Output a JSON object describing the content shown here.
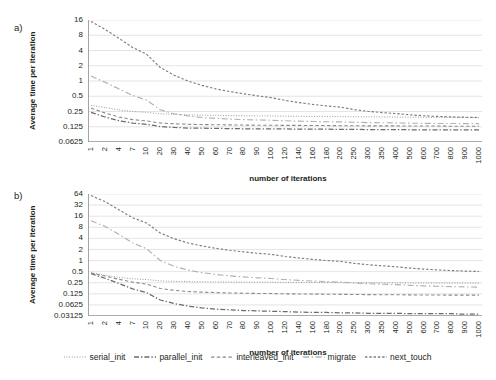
{
  "figure": {
    "panels": [
      {
        "id": "a",
        "label": "a)",
        "ylabel": "Average time per iteration",
        "xlabel": "number of iterations",
        "yticks": [
          "16",
          "8",
          "4",
          "2",
          "1",
          "0.5",
          "0.25",
          "0.125",
          "0.0625"
        ]
      },
      {
        "id": "b",
        "label": "b)",
        "ylabel": "Average time per iteration",
        "xlabel": "number of iterations",
        "yticks": [
          "64",
          "32",
          "16",
          "8",
          "4",
          "2",
          "1",
          "0.5",
          "0.25",
          "0.125",
          "0.0625",
          "0.03125"
        ]
      }
    ],
    "xticks": [
      "1",
      "2",
      "4",
      "7",
      "10",
      "20",
      "30",
      "40",
      "50",
      "60",
      "70",
      "80",
      "90",
      "100",
      "120",
      "140",
      "160",
      "180",
      "200",
      "250",
      "300",
      "350",
      "400",
      "500",
      "600",
      "700",
      "800",
      "900",
      "1000"
    ],
    "legend": [
      {
        "name": "serial_init",
        "style": "dotted",
        "color": "#8c8c8c"
      },
      {
        "name": "parallel_init",
        "style": "dashdot",
        "color": "#6e6e6e"
      },
      {
        "name": "interleaved_init",
        "style": "dashed",
        "color": "#8c8c8c"
      },
      {
        "name": "migrate",
        "style": "dashdot-long",
        "color": "#a8a8a8"
      },
      {
        "name": "next_touch",
        "style": "dash-short",
        "color": "#8c8c8c"
      }
    ]
  },
  "chart_data": [
    {
      "type": "line",
      "panel": "a",
      "title": "",
      "xlabel": "number of iterations",
      "ylabel": "Average time per iteration",
      "yscale": "log2",
      "ylim": [
        0.0625,
        16
      ],
      "yticks": [
        0.0625,
        0.125,
        0.25,
        0.5,
        1,
        2,
        4,
        8,
        16
      ],
      "grid": true,
      "legend_position": "bottom",
      "x": [
        1,
        2,
        4,
        7,
        10,
        20,
        30,
        40,
        50,
        60,
        70,
        80,
        90,
        100,
        120,
        140,
        160,
        180,
        200,
        250,
        300,
        350,
        400,
        500,
        600,
        700,
        800,
        900,
        1000
      ],
      "series": [
        {
          "name": "serial_init",
          "values": [
            0.33,
            0.3,
            0.27,
            0.25,
            0.24,
            0.225,
            0.22,
            0.215,
            0.212,
            0.21,
            0.208,
            0.206,
            0.205,
            0.204,
            0.202,
            0.201,
            0.2,
            0.199,
            0.198,
            0.197,
            0.196,
            0.195,
            0.194,
            0.193,
            0.192,
            0.191,
            0.19,
            0.19,
            0.189
          ]
        },
        {
          "name": "parallel_init",
          "values": [
            0.24,
            0.195,
            0.165,
            0.148,
            0.14,
            0.126,
            0.121,
            0.118,
            0.117,
            0.116,
            0.115,
            0.114,
            0.114,
            0.113,
            0.113,
            0.112,
            0.112,
            0.112,
            0.111,
            0.111,
            0.11,
            0.11,
            0.11,
            0.109,
            0.109,
            0.109,
            0.108,
            0.108,
            0.108
          ]
        },
        {
          "name": "interleaved_init",
          "values": [
            0.29,
            0.235,
            0.195,
            0.173,
            0.163,
            0.148,
            0.143,
            0.14,
            0.138,
            0.137,
            0.136,
            0.135,
            0.134,
            0.134,
            0.133,
            0.133,
            0.132,
            0.132,
            0.131,
            0.131,
            0.13,
            0.13,
            0.13,
            0.129,
            0.129,
            0.129,
            0.128,
            0.128,
            0.128
          ]
        },
        {
          "name": "migrate",
          "values": [
            1.25,
            0.95,
            0.7,
            0.52,
            0.42,
            0.27,
            0.225,
            0.205,
            0.19,
            0.183,
            0.177,
            0.173,
            0.17,
            0.168,
            0.164,
            0.161,
            0.159,
            0.157,
            0.156,
            0.153,
            0.151,
            0.15,
            0.149,
            0.147,
            0.146,
            0.145,
            0.145,
            0.144,
            0.144
          ]
        },
        {
          "name": "next_touch",
          "values": [
            15.0,
            10.5,
            7.0,
            4.6,
            3.4,
            1.85,
            1.3,
            1.0,
            0.82,
            0.7,
            0.62,
            0.56,
            0.51,
            0.47,
            0.415,
            0.375,
            0.345,
            0.322,
            0.305,
            0.272,
            0.252,
            0.238,
            0.228,
            0.215,
            0.206,
            0.2,
            0.196,
            0.193,
            0.19
          ]
        }
      ]
    },
    {
      "type": "line",
      "panel": "b",
      "title": "",
      "xlabel": "number of iterations",
      "ylabel": "Average time per iteration",
      "yscale": "log2",
      "ylim": [
        0.03125,
        64
      ],
      "yticks": [
        0.03125,
        0.0625,
        0.125,
        0.25,
        0.5,
        1,
        2,
        4,
        8,
        16,
        32,
        64
      ],
      "grid": true,
      "legend_position": "bottom",
      "x": [
        1,
        2,
        4,
        7,
        10,
        20,
        30,
        40,
        50,
        60,
        70,
        80,
        90,
        100,
        120,
        140,
        160,
        180,
        200,
        250,
        300,
        350,
        400,
        500,
        600,
        700,
        800,
        900,
        1000
      ],
      "series": [
        {
          "name": "serial_init",
          "values": [
            0.47,
            0.4,
            0.35,
            0.32,
            0.305,
            0.28,
            0.272,
            0.268,
            0.265,
            0.263,
            0.261,
            0.26,
            0.259,
            0.258,
            0.256,
            0.255,
            0.254,
            0.253,
            0.252,
            0.251,
            0.25,
            0.249,
            0.248,
            0.247,
            0.246,
            0.245,
            0.245,
            0.244,
            0.244
          ]
        },
        {
          "name": "parallel_init",
          "values": [
            0.44,
            0.33,
            0.24,
            0.17,
            0.135,
            0.085,
            0.068,
            0.058,
            0.052,
            0.048,
            0.046,
            0.044,
            0.043,
            0.042,
            0.041,
            0.04,
            0.039,
            0.039,
            0.038,
            0.038,
            0.037,
            0.037,
            0.037,
            0.036,
            0.036,
            0.036,
            0.036,
            0.035,
            0.035
          ]
        },
        {
          "name": "interleaved_init",
          "values": [
            0.46,
            0.38,
            0.31,
            0.26,
            0.23,
            0.175,
            0.155,
            0.145,
            0.139,
            0.135,
            0.132,
            0.13,
            0.128,
            0.127,
            0.125,
            0.124,
            0.123,
            0.122,
            0.121,
            0.12,
            0.119,
            0.118,
            0.118,
            0.117,
            0.116,
            0.116,
            0.115,
            0.115,
            0.115
          ]
        },
        {
          "name": "migrate",
          "values": [
            12.0,
            8.5,
            5.2,
            3.0,
            2.1,
            1.0,
            0.7,
            0.55,
            0.47,
            0.42,
            0.385,
            0.36,
            0.34,
            0.325,
            0.305,
            0.29,
            0.278,
            0.268,
            0.26,
            0.245,
            0.235,
            0.228,
            0.222,
            0.212,
            0.205,
            0.2,
            0.196,
            0.192,
            0.19
          ]
        },
        {
          "name": "next_touch",
          "values": [
            58.0,
            40.0,
            24.0,
            14.5,
            10.5,
            5.6,
            3.9,
            3.0,
            2.5,
            2.15,
            1.9,
            1.72,
            1.58,
            1.47,
            1.29,
            1.17,
            1.08,
            1.0,
            0.95,
            0.84,
            0.77,
            0.72,
            0.68,
            0.625,
            0.585,
            0.555,
            0.535,
            0.518,
            0.505
          ]
        }
      ]
    }
  ]
}
